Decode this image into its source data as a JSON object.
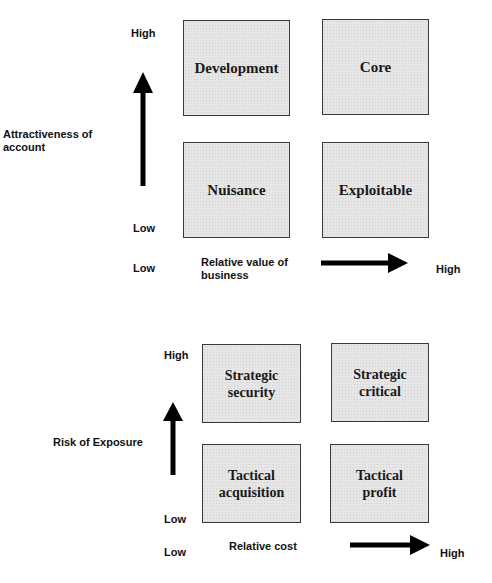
{
  "diagram1": {
    "y_axis_label": "Attractiveness of account",
    "y_high": "High",
    "y_low": "Low",
    "x_low": "Low",
    "x_axis_label": "Relative value of business",
    "x_high": "High",
    "quadrants": {
      "top_left": "Development",
      "top_right": "Core",
      "bottom_left": "Nuisance",
      "bottom_right": "Exploitable"
    }
  },
  "diagram2": {
    "y_axis_label": "Risk of Exposure",
    "y_high": "High",
    "y_low": "Low",
    "x_low": "Low",
    "x_axis_label": "Relative cost",
    "x_high": "High",
    "quadrants": {
      "top_left": "Strategic\nsecurity",
      "top_right": "Strategic\ncritical",
      "bottom_left": "Tactical\nacquisition",
      "bottom_right": "Tactical\nprofit"
    }
  },
  "colors": {
    "box_fill": "#e6e6e6",
    "box_border": "#3a3a3a",
    "arrow": "#000000"
  }
}
